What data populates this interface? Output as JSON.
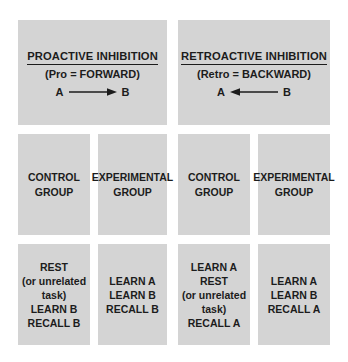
{
  "diagram": {
    "background_color": "#ffffff",
    "box_color": "#d4d4d4",
    "text_color": "#1c1c1c"
  },
  "headers": [
    {
      "title": "PROACTIVE INHIBITION",
      "subtitle": "(Pro = FORWARD)",
      "arrow": {
        "left_label": "A",
        "right_label": "B",
        "direction": "right",
        "icon": "arrow-right-icon"
      }
    },
    {
      "title": "RETROACTIVE INHIBITION",
      "subtitle": "(Retro = BACKWARD)",
      "arrow": {
        "left_label": "A",
        "right_label": "B",
        "direction": "left",
        "icon": "arrow-left-icon"
      }
    }
  ],
  "groups": [
    {
      "line1": "CONTROL",
      "line2": "GROUP"
    },
    {
      "line1": "EXPERIMENTAL",
      "line2": "GROUP"
    },
    {
      "line1": "CONTROL",
      "line2": "GROUP"
    },
    {
      "line1": "EXPERIMENTAL",
      "line2": "GROUP"
    }
  ],
  "procedures": [
    {
      "lines": [
        "REST",
        "(or unrelated",
        "task)",
        "LEARN B",
        "RECALL B"
      ],
      "l1": "REST",
      "l2": "(or unrelated",
      "l3": "task)",
      "l4": "LEARN B",
      "l5": "RECALL B"
    },
    {
      "lines": [
        "LEARN A",
        "LEARN B",
        "RECALL B"
      ],
      "l1": "LEARN A",
      "l2": "LEARN B",
      "l3": "RECALL B"
    },
    {
      "lines": [
        "LEARN A",
        "REST",
        "(or unrelated",
        "task)",
        "RECALL A"
      ],
      "l1": "LEARN A",
      "l2": "REST",
      "l3": "(or unrelated",
      "l4": "task)",
      "l5": "RECALL A"
    },
    {
      "lines": [
        "LEARN A",
        "LEARN B",
        "RECALL A"
      ],
      "l1": "LEARN A",
      "l2": "LEARN B",
      "l3": "RECALL A"
    }
  ]
}
